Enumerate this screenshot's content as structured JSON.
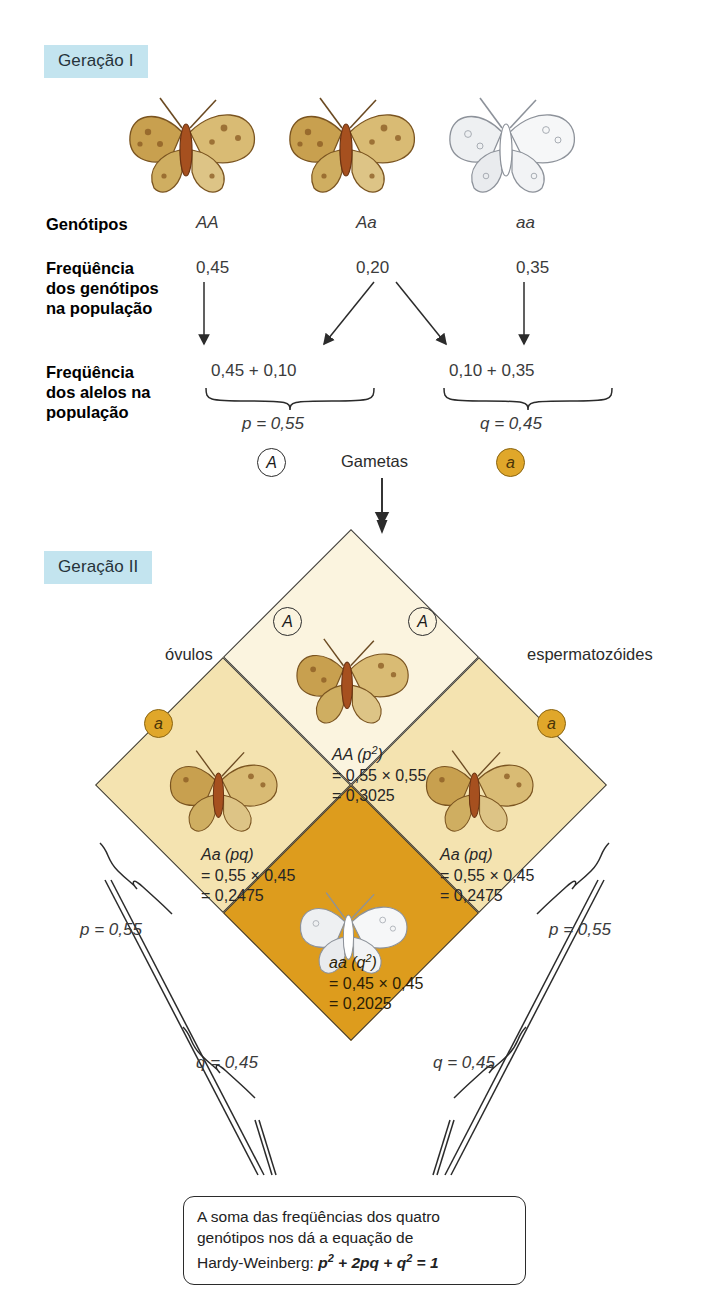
{
  "generation1": {
    "banner": "Geração I",
    "rows": [
      {
        "label": "Genótipos",
        "values": [
          "AA",
          "Aa",
          "aa"
        ]
      },
      {
        "label": "Freqüência\ndos genótipos\nna população",
        "values": [
          "0,45",
          "0,20",
          "0,35"
        ]
      },
      {
        "label": "Freqüência\ndos alelos na\npopulação",
        "values": [
          "0,45 + 0,10",
          "0,10 + 0,35"
        ]
      }
    ],
    "label_genotypes": "Genótipos",
    "label_freq_genotypes_l1": "Freqüência",
    "label_freq_genotypes_l2": "dos genótipos",
    "label_freq_genotypes_l3": "na população",
    "label_freq_alleles_l1": "Freqüência",
    "label_freq_alleles_l2": "dos alelos na",
    "label_freq_alleles_l3": "população",
    "genotype_AA": "AA",
    "genotype_Aa": "Aa",
    "genotype_aa": "aa",
    "freq_AA": "0,45",
    "freq_Aa": "0,20",
    "freq_aa": "0,35",
    "sum_left": "0,45 + 0,10",
    "sum_right": "0,10 + 0,35",
    "p_value": "p = 0,55",
    "q_value": "q = 0,45",
    "allele_A": "A",
    "allele_a": "a",
    "gametes_label": "Gametas"
  },
  "generation2": {
    "banner": "Geração II",
    "ovules_label": "óvulos",
    "sperm_label": "espermatozóides",
    "allele_A": "A",
    "allele_a": "a",
    "cells": {
      "AA": {
        "genotype": "AA (p",
        "exp": "2",
        "close": ")",
        "line2": "= 0,55 × 0,55",
        "line3": "= 0,3025"
      },
      "Aa_left": {
        "genotype": "Aa (pq)",
        "line2": "= 0,55 × 0,45",
        "line3": "= 0,2475"
      },
      "Aa_right": {
        "genotype": "Aa (pq)",
        "line2": "= 0,55 × 0,45",
        "line3": "= 0,2475"
      },
      "aa": {
        "genotype": "aa (q",
        "exp": "2",
        "close": ")",
        "line2": "= 0,45 × 0,45",
        "line3": "= 0,2025"
      }
    },
    "brace_p_left": "p = 0,55",
    "brace_q_left": "q = 0,45",
    "brace_p_right": "p = 0,55",
    "brace_q_right": "q = 0,45"
  },
  "caption": {
    "line1": "A soma das freqüências dos quatro",
    "line2": "genótipos nos dá a equação de",
    "line3_prefix": "Hardy-Weinberg: ",
    "formula": "p2 + 2pq + q2 = 1"
  },
  "colors": {
    "banner_bg": "#c3e4ef",
    "cell_AA": "#fbf4df",
    "cell_Aa": "#f4e3b0",
    "cell_aa": "#dd9c1d",
    "badge_fill": "#e0a72a",
    "stroke": "#3a3a3a"
  }
}
